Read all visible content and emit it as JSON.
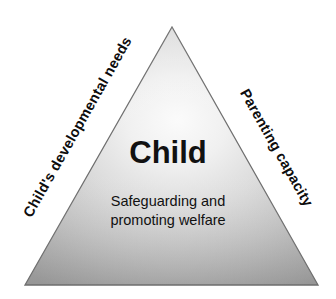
{
  "diagram": {
    "type": "assessment-framework-triangle",
    "shape": "triangle",
    "center": {
      "title": "Child",
      "subtitle_line_1": "Safeguarding and",
      "subtitle_line_2": "promoting welfare"
    },
    "sides": {
      "left_label": "Child's developmental needs",
      "right_label": "Parenting capacity"
    },
    "colors": {
      "background": "#ffffff",
      "fill_highlight": "#f2f2f2",
      "fill_mid": "#c9c9c9",
      "fill_dark": "#9c9c9c",
      "outline": "#6e6e6e",
      "text": "#111111"
    },
    "geometry": {
      "apex_x": 172,
      "apex_y": 27,
      "bottom_left_x": 25,
      "bottom_left_y": 285,
      "bottom_right_x": 318,
      "bottom_right_y": 285,
      "left_label_rotation_deg": -60.5,
      "right_label_rotation_deg": 60.5
    }
  }
}
